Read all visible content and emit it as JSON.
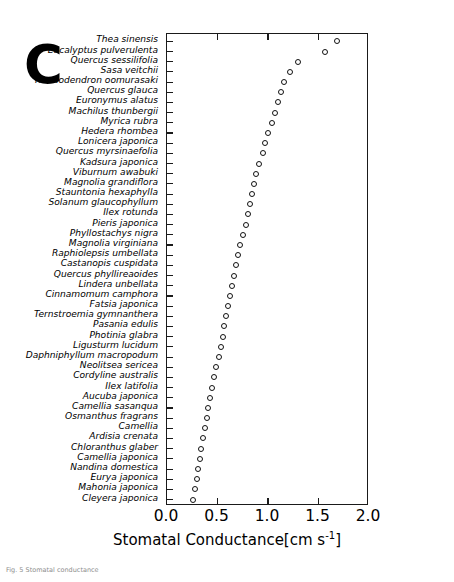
{
  "figure": {
    "panel_letter": "C",
    "caption": "Fig. 5  Stomatal conductance"
  },
  "axis": {
    "x_title_main": "Stomatal Conductance[cm s",
    "x_title_sup": "-1",
    "x_title_end": "]",
    "x_ticks": [
      "0.0",
      "0.5",
      "1.0",
      "1.5",
      "2.0"
    ],
    "x_tick_values": [
      0.0,
      0.5,
      1.0,
      1.5,
      2.0
    ],
    "xlim": [
      0.0,
      2.0
    ]
  },
  "chart_data": {
    "type": "scatter",
    "title": "C",
    "xlabel": "Stomatal Conductance[cm s-1]",
    "ylabel": "",
    "xlim": [
      0.0,
      2.0
    ],
    "grid": false,
    "legend": null,
    "marker": "open-circle",
    "orientation": "horizontal-ranked",
    "categories": [
      "Thea sinensis",
      "Eucalyptus pulverulenta",
      "Quercus sessilifolia",
      "Sasa veitchii",
      "Rhododendron oomurasaki",
      "Quercus glauca",
      "Euronymus alatus",
      "Machilus thunbergii",
      "Myrica rubra",
      "Hedera rhombea",
      "Lonicera japonica",
      "Quercus myrsinaefolia",
      "Kadsura japonica",
      "Viburnum awabuki",
      "Magnolia grandiflora",
      "Stauntonia hexaphylla",
      "Solanum glaucophyllum",
      "Ilex rotunda",
      "Pieris japonica",
      "Phyllostachys nigra",
      "Magnolia virginiana",
      "Raphiolepsis umbellata",
      "Castanopis cuspidata",
      "Quercus phyllireaoides",
      "Lindera unbellata",
      "Cinnamomum camphora",
      "Fatsia japonica",
      "Ternstroemia gymnanthera",
      "Pasania edulis",
      "Photinia glabra",
      "Ligusturm lucidum",
      "Daphniphyllum macropodum",
      "Neolitsea sericea",
      "Cordyline australis",
      "Ilex latifolia",
      "Aucuba japonica",
      "Camellia sasanqua",
      "Osmanthus fragrans",
      "Camellia",
      "Ardisia crenata",
      "Chloranthus glaber",
      "Camellia japonica",
      "Nandina domestica",
      "Eurya japonica",
      "Mahonia japonica",
      "Cleyera japonica"
    ],
    "values": [
      1.68,
      1.56,
      1.3,
      1.22,
      1.16,
      1.13,
      1.1,
      1.07,
      1.04,
      1.0,
      0.97,
      0.95,
      0.91,
      0.88,
      0.86,
      0.84,
      0.82,
      0.8,
      0.78,
      0.75,
      0.72,
      0.7,
      0.68,
      0.66,
      0.64,
      0.62,
      0.6,
      0.58,
      0.56,
      0.55,
      0.53,
      0.51,
      0.49,
      0.47,
      0.45,
      0.43,
      0.41,
      0.4,
      0.38,
      0.36,
      0.34,
      0.33,
      0.31,
      0.3,
      0.28,
      0.26
    ]
  }
}
